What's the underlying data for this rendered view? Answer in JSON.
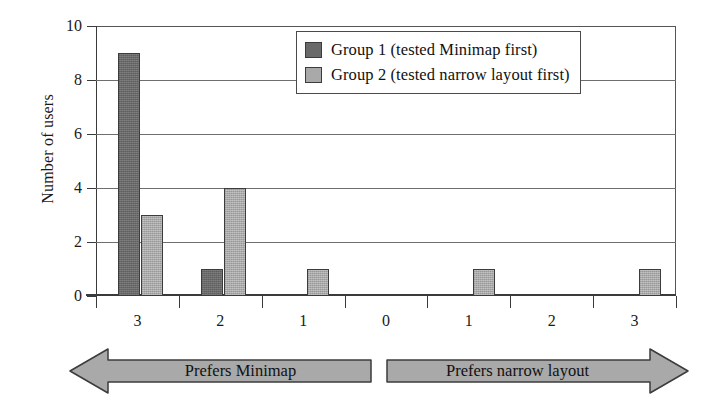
{
  "chart_data": {
    "type": "bar",
    "title": "",
    "xlabel": "",
    "ylabel": "Number of users",
    "ylim": [
      0,
      10
    ],
    "yticks": [
      0,
      2,
      4,
      6,
      8,
      10
    ],
    "grid": true,
    "legend_position": "top-right",
    "categories": [
      "3",
      "2",
      "1",
      "0",
      "1",
      "2",
      "3"
    ],
    "series": [
      {
        "name": "Group 1 (tested Minimap first)",
        "color": "#6a6a6a",
        "values": [
          9,
          1,
          0,
          0,
          0,
          0,
          0
        ]
      },
      {
        "name": "Group 2 (tested narrow layout first)",
        "color": "#a9a9a9",
        "values": [
          3,
          4,
          1,
          0,
          1,
          0,
          1
        ]
      }
    ],
    "annotations": [
      {
        "text": "Prefers Minimap",
        "direction": "left"
      },
      {
        "text": "Prefers narrow layout",
        "direction": "right"
      }
    ]
  },
  "axes": {
    "y_title": "Number of users",
    "y_ticks": [
      "0",
      "2",
      "4",
      "6",
      "8",
      "10"
    ],
    "x_ticks": [
      "3",
      "2",
      "1",
      "0",
      "1",
      "2",
      "3"
    ]
  },
  "legend": {
    "entries": [
      {
        "label": "Group 1 (tested Minimap first)"
      },
      {
        "label": "Group 2 (tested narrow layout first)"
      }
    ]
  },
  "banners": {
    "left": {
      "label": "Prefers Minimap"
    },
    "right": {
      "label": "Prefers narrow layout"
    }
  }
}
